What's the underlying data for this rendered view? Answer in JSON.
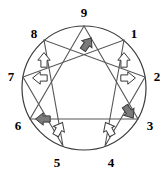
{
  "diagram": {
    "type": "enneagram-figure",
    "background_color": "#ffffff",
    "stroke_color": "#3a3a3a",
    "label_color": "#000000",
    "circle": {
      "center_x": 84,
      "center_y": 88,
      "radius": 62
    },
    "points": [
      {
        "id": "p9",
        "label": "9",
        "angle_deg": 90,
        "x": 84,
        "y": 26,
        "label_x": 84,
        "label_y": 12
      },
      {
        "id": "p1",
        "label": "1",
        "angle_deg": 50,
        "x": 124,
        "y": 40,
        "label_x": 134,
        "label_y": 33
      },
      {
        "id": "p2",
        "label": "2",
        "angle_deg": 10,
        "x": 145,
        "y": 77,
        "label_x": 157,
        "label_y": 76
      },
      {
        "id": "p3",
        "label": "3",
        "angle_deg": -30,
        "x": 138,
        "y": 119,
        "label_x": 150,
        "label_y": 125
      },
      {
        "id": "p4",
        "label": "4",
        "angle_deg": -70,
        "x": 105,
        "y": 146,
        "label_x": 111,
        "label_y": 162
      },
      {
        "id": "p5",
        "label": "5",
        "angle_deg": -110,
        "x": 63,
        "y": 146,
        "label_x": 57,
        "label_y": 162
      },
      {
        "id": "p6",
        "label": "6",
        "angle_deg": -150,
        "x": 30,
        "y": 119,
        "label_x": 18,
        "label_y": 125
      },
      {
        "id": "p7",
        "label": "7",
        "angle_deg": 170,
        "x": 23,
        "y": 77,
        "label_x": 11,
        "label_y": 76
      },
      {
        "id": "p8",
        "label": "8",
        "angle_deg": 130,
        "x": 44,
        "y": 40,
        "label_x": 34,
        "label_y": 33
      }
    ],
    "triangle_path": "p9-p3-p6-p9",
    "hexad_path": "p1-p4-p2-p8-p5-p7-p1",
    "arrows": [
      {
        "id": "arrow-9",
        "near_point": "9",
        "style": "filled",
        "fill": "#7a7a7a",
        "direction": "up-right",
        "x": 87,
        "y": 44,
        "rotation": 35
      },
      {
        "id": "arrow-1",
        "near_point": "1",
        "style": "outline",
        "fill": "#ffffff",
        "direction": "up",
        "x": 124,
        "y": 60,
        "rotation": 0
      },
      {
        "id": "arrow-2",
        "near_point": "2",
        "style": "outline",
        "fill": "#ffffff",
        "direction": "right",
        "x": 128,
        "y": 78,
        "rotation": 90
      },
      {
        "id": "arrow-3",
        "near_point": "3",
        "style": "filled",
        "fill": "#7a7a7a",
        "direction": "down-right",
        "x": 129,
        "y": 112,
        "rotation": 145
      },
      {
        "id": "arrow-4",
        "near_point": "4",
        "style": "outline",
        "fill": "#ffffff",
        "direction": "up-left",
        "x": 109,
        "y": 129,
        "rotation": -28
      },
      {
        "id": "arrow-5",
        "near_point": "5",
        "style": "outline",
        "fill": "#ffffff",
        "direction": "up-right",
        "x": 59,
        "y": 129,
        "rotation": 28
      },
      {
        "id": "arrow-6",
        "near_point": "6",
        "style": "filled",
        "fill": "#7a7a7a",
        "direction": "left",
        "x": 43,
        "y": 119,
        "rotation": -90
      },
      {
        "id": "arrow-7",
        "near_point": "7",
        "style": "outline",
        "fill": "#ffffff",
        "direction": "left",
        "x": 40,
        "y": 78,
        "rotation": -90
      },
      {
        "id": "arrow-8",
        "near_point": "8",
        "style": "outline",
        "fill": "#ffffff",
        "direction": "up",
        "x": 44,
        "y": 60,
        "rotation": 0
      }
    ]
  }
}
